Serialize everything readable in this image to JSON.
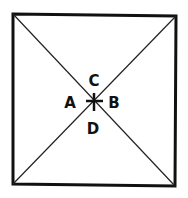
{
  "diagram": {
    "type": "square-with-diagonals",
    "labels": {
      "top": "C",
      "left": "A",
      "right": "B",
      "bottom": "D"
    },
    "center_marker": "cross",
    "colors": {
      "stroke": "#111111",
      "background": "#ffffff"
    }
  }
}
